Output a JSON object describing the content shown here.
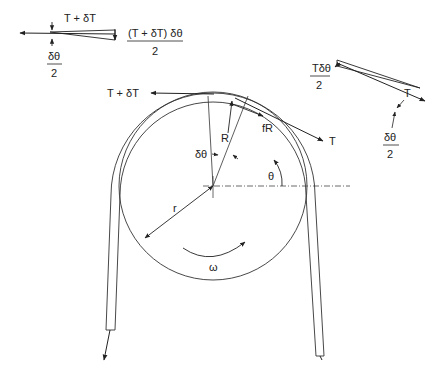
{
  "diagram": {
    "labels": {
      "tight_tangent": "T + δT",
      "slack_tangent": "T",
      "normal_force": "R",
      "friction_force": "fR",
      "element_angle": "δθ",
      "position_angle": "θ",
      "radius": "r",
      "angular_velocity": "ω",
      "tension_left": "T",
      "tension_left_sub": "1",
      "tension_right": "T",
      "tension_right_sub": "2"
    },
    "inset_left": {
      "force_label": "T + δT",
      "half_angle_num": "δθ",
      "half_angle_den": "2",
      "component_num": "(T + δT) δθ",
      "component_den": "2"
    },
    "inset_right": {
      "force_label": "T",
      "half_angle_num": "δθ",
      "half_angle_den": "2",
      "component_num": "Tδθ",
      "component_den": "2"
    },
    "geometry": {
      "center": [
        213,
        186
      ],
      "pulley_radius": 94
    },
    "colors": {
      "ink": "#222222",
      "background": "#ffffff"
    }
  }
}
